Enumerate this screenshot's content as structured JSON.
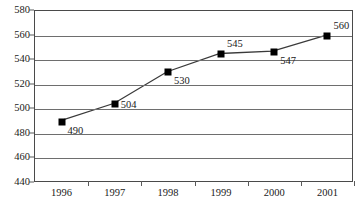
{
  "chart_data": {
    "type": "line",
    "title": "",
    "subtitle": "",
    "xlabel": "",
    "ylabel": "",
    "categories": [
      "1996",
      "1997",
      "1998",
      "1999",
      "2000",
      "2001"
    ],
    "values": [
      490,
      504,
      530,
      545,
      547,
      560
    ],
    "data_labels": [
      "490",
      "504",
      "530",
      "545",
      "547",
      "560"
    ],
    "label_positions": [
      "below-right",
      "right",
      "below-right",
      "above-right",
      "below-right",
      "above-right"
    ],
    "series": [
      {
        "name": "",
        "values": [
          490,
          504,
          530,
          545,
          547,
          560
        ]
      }
    ],
    "ylim": [
      440,
      580
    ],
    "ytick_step": 20,
    "ytick_labels": [
      "580",
      "560",
      "540",
      "520",
      "500",
      "480",
      "460",
      "440"
    ],
    "ytick_values": [
      580,
      560,
      540,
      520,
      500,
      480,
      460,
      440
    ],
    "grid": true,
    "grid_axis": "y",
    "legend": false,
    "legend_position": "none",
    "marker": "square",
    "marker_color": "#000000",
    "line_color": "#3a3a3a",
    "grid_color": "#6e6e6e",
    "axis_color": "#4a4a4a",
    "background": "#ffffff"
  }
}
